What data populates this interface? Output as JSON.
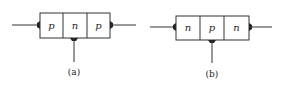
{
  "diagrams": [
    {
      "id": "a",
      "caption": "(a)",
      "regions": [
        "p",
        "n",
        "p"
      ],
      "box": {
        "x": 40,
        "y": 13,
        "w": 70,
        "h": 25
      },
      "base_x": 74,
      "lead_y": 25,
      "left_lead_x": 12,
      "right_lead_x": 136,
      "base_end_y": 62,
      "caption_y": 75
    },
    {
      "id": "b",
      "caption": "(b)",
      "regions": [
        "n",
        "p",
        "n"
      ],
      "box": {
        "x": 176,
        "y": 16,
        "w": 73,
        "h": 24
      },
      "base_x": 212,
      "lead_y": 27,
      "left_lead_x": 150,
      "right_lead_x": 272,
      "base_end_y": 63,
      "caption_y": 77
    }
  ],
  "colors": {
    "line": "#333333",
    "background": "#ffffff"
  }
}
